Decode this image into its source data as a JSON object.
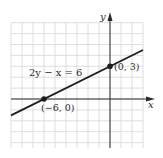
{
  "chart_data": {
    "type": "line",
    "title": "",
    "xlabel": "x",
    "ylabel": "y",
    "equation": "2y − x = 6",
    "xlim": [
      -9,
      3
    ],
    "ylim": [
      -5,
      7
    ],
    "grid": true,
    "series": [
      {
        "name": "2y − x = 6",
        "x": [
          -9,
          3
        ],
        "y": [
          -1.5,
          4.5
        ]
      }
    ],
    "points": [
      {
        "x": -6,
        "y": 0,
        "label": "(−6, 0)"
      },
      {
        "x": 0,
        "y": 3,
        "label": "(0, 3)"
      }
    ]
  },
  "colors": {
    "grid": "#d6d6d6",
    "axis": "#2a2a2a",
    "line": "#1e1e1e"
  }
}
